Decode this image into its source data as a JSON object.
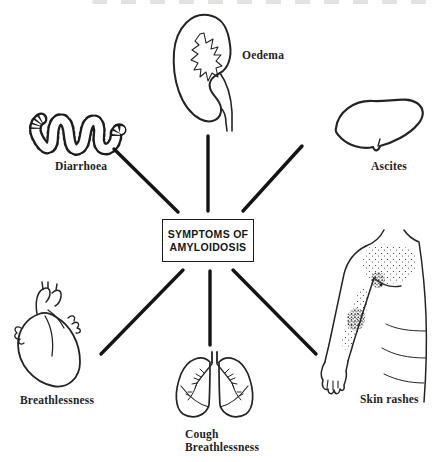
{
  "meta": {
    "background_color": "#ffffff",
    "ink_color": "#1a1a1a"
  },
  "center_box": {
    "line1": "SYMPTOMS OF",
    "line2": "AMYLOIDOSIS"
  },
  "nodes": [
    {
      "id": "oedema",
      "organ": "kidney",
      "label": "Oedema"
    },
    {
      "id": "diarrhoea",
      "organ": "intestine",
      "label": "Diarrhoea"
    },
    {
      "id": "ascites",
      "organ": "liver",
      "label": "Ascites"
    },
    {
      "id": "breathlessness",
      "organ": "heart",
      "label": "Breathlessness"
    },
    {
      "id": "cough-breathlessness",
      "organ": "lungs",
      "label_line1": "Cough",
      "label_line2": "Breathlessness"
    },
    {
      "id": "skin-rashes",
      "organ": "arm-torso",
      "label": "Skin rashes"
    }
  ]
}
